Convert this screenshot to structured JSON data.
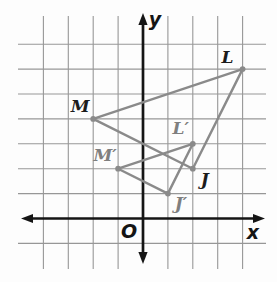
{
  "figure": {
    "canvas": {
      "width": 277,
      "height": 282
    },
    "colors": {
      "background": "#fdfdfd",
      "grid": "#979797",
      "axis": "#151515",
      "shape": "#8a8a8a",
      "preimage_label": "#1c1c1c",
      "image_label": "#7f7f7f"
    },
    "axis_labels": {
      "x": "x",
      "y": "y",
      "origin": "O"
    },
    "coordinate_system": {
      "origin_px": {
        "x": 143,
        "y": 218.5
      },
      "unit_px": 24.9,
      "grid_v_units": [
        -4,
        -3,
        -2,
        -1,
        1,
        2,
        3,
        4
      ],
      "grid_v_extent_px": [
        16,
        269
      ],
      "grid_h_units": [
        -1,
        1,
        2,
        3,
        4,
        5,
        6,
        7
      ],
      "grid_h_extent_px": [
        18,
        266
      ],
      "x_axis_extent_px": [
        21,
        265
      ],
      "y_axis_extent_px": [
        13,
        264
      ]
    },
    "triangles": [
      {
        "name": "LMJ",
        "role": "preimage",
        "label_color_key": "preimage_label",
        "vertices": [
          {
            "label": "L",
            "coords": [
              4,
              6
            ],
            "label_offset_px": [
              -15,
              -12
            ]
          },
          {
            "label": "M",
            "coords": [
              -2,
              4
            ],
            "label_offset_px": [
              -13,
              -12
            ]
          },
          {
            "label": "J",
            "coords": [
              2,
              2
            ],
            "label_offset_px": [
              12,
              11
            ]
          }
        ]
      },
      {
        "name": "L'M'J'",
        "role": "image",
        "label_color_key": "image_label",
        "vertices": [
          {
            "label": "L′",
            "coords": [
              2,
              3
            ],
            "label_offset_px": [
              -12,
              -15
            ]
          },
          {
            "label": "M′",
            "coords": [
              -1,
              2
            ],
            "label_offset_px": [
              -13,
              -13
            ]
          },
          {
            "label": "J′",
            "coords": [
              1,
              1
            ],
            "label_offset_px": [
              13,
              10
            ]
          }
        ]
      }
    ]
  }
}
